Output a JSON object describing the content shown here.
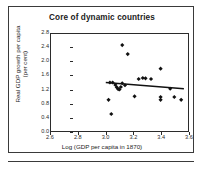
{
  "figure": {
    "title": "Core of dynamic countries",
    "xaxis_title": "Log (GDP per capita in 1870)",
    "yaxis_title_line1": "Real GDP growth per capita",
    "yaxis_title_line2": "(per cent)",
    "frame_color": "#3a3a3a",
    "marker_color": "#111111",
    "trendline_color": "#111111"
  },
  "chart_data": {
    "type": "scatter",
    "title": "Core of dynamic countries",
    "xlabel": "Log (GDP per capita in 1870)",
    "ylabel": "Real GDP growth per capita (per cent)",
    "xlim": [
      2.6,
      3.6
    ],
    "ylim": [
      0.0,
      2.8
    ],
    "xticks": [
      2.6,
      2.8,
      3.0,
      3.2,
      3.4,
      3.6
    ],
    "xtick_labels": [
      "2.6",
      "2.8",
      "3.0",
      "3.2",
      "3.4",
      "3.6"
    ],
    "yticks": [
      0.0,
      0.4,
      0.8,
      1.2,
      1.6,
      2.0,
      2.4,
      2.8
    ],
    "ytick_labels": [
      "0.0",
      "0.4",
      "0.8",
      "1.2",
      "1.6",
      "2.0",
      "2.4",
      "2.8"
    ],
    "grid": false,
    "legend": null,
    "marker": "diamond",
    "points": [
      {
        "x": 3.02,
        "y": 0.9
      },
      {
        "x": 3.04,
        "y": 0.49
      },
      {
        "x": 3.03,
        "y": 1.4
      },
      {
        "x": 3.05,
        "y": 1.4
      },
      {
        "x": 3.07,
        "y": 1.33
      },
      {
        "x": 3.08,
        "y": 1.26
      },
      {
        "x": 3.09,
        "y": 1.21
      },
      {
        "x": 3.1,
        "y": 1.2
      },
      {
        "x": 3.11,
        "y": 1.27
      },
      {
        "x": 3.12,
        "y": 1.38
      },
      {
        "x": 3.12,
        "y": 2.48
      },
      {
        "x": 3.14,
        "y": 1.32
      },
      {
        "x": 3.16,
        "y": 2.22
      },
      {
        "x": 3.21,
        "y": 1.0
      },
      {
        "x": 3.24,
        "y": 1.5
      },
      {
        "x": 3.27,
        "y": 1.53
      },
      {
        "x": 3.29,
        "y": 1.52
      },
      {
        "x": 3.33,
        "y": 1.5
      },
      {
        "x": 3.4,
        "y": 1.8
      },
      {
        "x": 3.4,
        "y": 0.98
      },
      {
        "x": 3.4,
        "y": 0.9
      },
      {
        "x": 3.47,
        "y": 1.22
      },
      {
        "x": 3.5,
        "y": 0.98
      },
      {
        "x": 3.55,
        "y": 0.9
      }
    ],
    "trendline": {
      "x_start": 3.0,
      "y_start": 1.4,
      "x_end": 3.57,
      "y_end": 1.22
    }
  }
}
